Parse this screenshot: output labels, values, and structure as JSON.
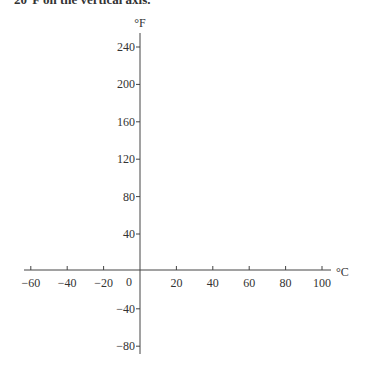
{
  "caption_fragment": "20°F on the vertical axis.",
  "chart_data": {
    "type": "line",
    "title": "",
    "xlabel": "°C",
    "ylabel": "°F",
    "x_ticks": [
      -60,
      -40,
      -20,
      0,
      20,
      40,
      60,
      80,
      100
    ],
    "y_ticks": [
      240,
      200,
      160,
      120,
      80,
      40,
      -40,
      -80
    ],
    "xlim": [
      -63,
      105
    ],
    "ylim": [
      -88,
      255
    ],
    "grid": false,
    "series": []
  },
  "axes": {
    "x_label": "°C",
    "y_label": "°F",
    "origin_label": "0"
  }
}
